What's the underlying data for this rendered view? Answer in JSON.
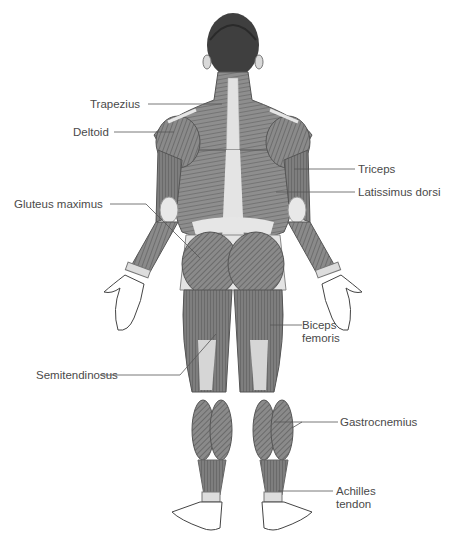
{
  "diagram": {
    "colors": {
      "muscle_dark": "#6b6b6b",
      "muscle_mid": "#9a9a9a",
      "tendon_light": "#e2e2e2",
      "skin": "#ffffff",
      "leader_line": "#555555",
      "text": "#4a4a4a"
    },
    "labels": {
      "trapezius": {
        "text": "Trapezius",
        "side": "left"
      },
      "deltoid": {
        "text": "Deltoid",
        "side": "left"
      },
      "gluteus_maximus": {
        "text": "Gluteus maximus",
        "side": "left"
      },
      "semitendinosus": {
        "text": "Semitendinosus",
        "side": "left"
      },
      "triceps": {
        "text": "Triceps",
        "side": "right"
      },
      "latissimus_dorsi": {
        "text": "Latissimus dorsi",
        "side": "right"
      },
      "biceps_femoris_line1": {
        "text": "Biceps",
        "side": "right"
      },
      "biceps_femoris_line2": {
        "text": "femoris",
        "side": "right"
      },
      "gastrocnemius": {
        "text": "Gastrocnemius",
        "side": "right"
      },
      "achilles_line1": {
        "text": "Achilles",
        "side": "right"
      },
      "achilles_line2": {
        "text": "tendon",
        "side": "right"
      }
    }
  }
}
